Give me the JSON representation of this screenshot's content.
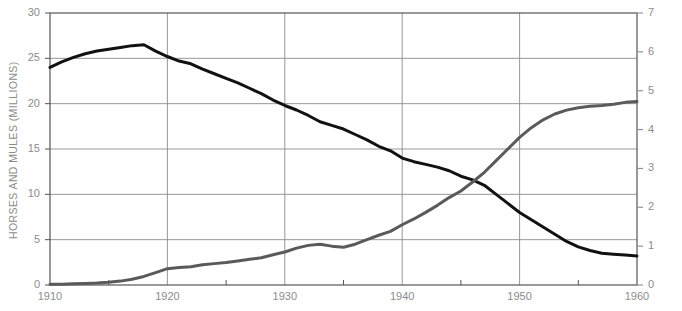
{
  "chart_data": {
    "type": "line",
    "title": "",
    "xlabel": "",
    "grid": true,
    "legend_position": "none",
    "x": [
      1910,
      1911,
      1912,
      1913,
      1914,
      1915,
      1916,
      1917,
      1918,
      1919,
      1920,
      1921,
      1922,
      1923,
      1924,
      1925,
      1926,
      1927,
      1928,
      1929,
      1930,
      1931,
      1932,
      1933,
      1934,
      1935,
      1936,
      1937,
      1938,
      1939,
      1940,
      1941,
      1942,
      1943,
      1944,
      1945,
      1946,
      1947,
      1948,
      1949,
      1950,
      1951,
      1952,
      1953,
      1954,
      1955,
      1956,
      1957,
      1958,
      1959,
      1960
    ],
    "xlim": [
      1910,
      1960
    ],
    "xticks": [
      1910,
      1920,
      1930,
      1940,
      1950,
      1960
    ],
    "xticklabels": [
      "1910",
      "1920",
      "1930",
      "1940",
      "1950",
      "1960"
    ],
    "xminor_ticks": [
      1915,
      1925,
      1935,
      1945,
      1955
    ],
    "series": [
      {
        "name": "Horses and mules",
        "axis": "left",
        "color": "#111111",
        "linewidth": 3,
        "ylabel": "HORSES AND MULES (MILLIONS)",
        "ylim": [
          0,
          30
        ],
        "yticks": [
          0,
          5,
          10,
          15,
          20,
          25,
          30
        ],
        "yticklabels": [
          "0",
          "5",
          "10",
          "15",
          "20",
          "25",
          "30"
        ],
        "values": [
          24.0,
          24.6,
          25.1,
          25.5,
          25.8,
          26.0,
          26.2,
          26.4,
          26.5,
          25.8,
          25.2,
          24.7,
          24.4,
          23.8,
          23.3,
          22.8,
          22.3,
          21.7,
          21.1,
          20.4,
          19.8,
          19.3,
          18.7,
          18.0,
          17.6,
          17.2,
          16.6,
          16.0,
          15.3,
          14.8,
          14.0,
          13.6,
          13.3,
          13.0,
          12.6,
          12.0,
          11.6,
          11.0,
          10.0,
          9.0,
          8.0,
          7.2,
          6.4,
          5.6,
          4.8,
          4.2,
          3.8,
          3.5,
          3.4,
          3.3,
          3.2
        ]
      },
      {
        "name": "Tractors",
        "axis": "right",
        "color": "#5a5a5a",
        "linewidth": 3,
        "ylabel": "TRACTORS (MILLIONS)",
        "ylim": [
          0,
          7
        ],
        "yticks": [
          0,
          1,
          2,
          3,
          4,
          5,
          6,
          7
        ],
        "yticklabels": [
          "0",
          "1",
          "2",
          "3",
          "4",
          "5",
          "6",
          "7"
        ],
        "values": [
          0.02,
          0.02,
          0.03,
          0.04,
          0.05,
          0.07,
          0.1,
          0.15,
          0.22,
          0.32,
          0.42,
          0.45,
          0.47,
          0.52,
          0.55,
          0.58,
          0.62,
          0.66,
          0.7,
          0.78,
          0.85,
          0.95,
          1.02,
          1.05,
          1.0,
          0.97,
          1.05,
          1.17,
          1.28,
          1.38,
          1.55,
          1.7,
          1.87,
          2.05,
          2.25,
          2.42,
          2.65,
          2.9,
          3.2,
          3.5,
          3.8,
          4.05,
          4.25,
          4.4,
          4.5,
          4.56,
          4.6,
          4.62,
          4.65,
          4.7,
          4.72
        ]
      }
    ],
    "annotations": {
      "crossover_year": 1946,
      "crossover_horses_millions": 11.6,
      "crossover_tractors_millions": 2.65
    }
  },
  "plot_area": {
    "left": 50,
    "top": 13,
    "right": 637,
    "bottom": 285,
    "grid_color": "#8c8c8c",
    "frame_color": "#555555",
    "background": "#ffffff"
  }
}
